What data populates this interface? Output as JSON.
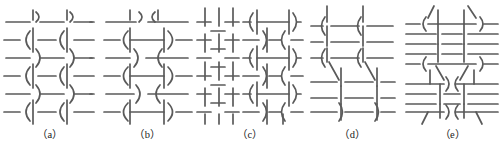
{
  "figure": {
    "type": "textile-weave-structure-diagrams",
    "background_color": "#ffffff",
    "stroke_color": "#5a5a5a",
    "stroke_color_dark": "#4a4a4a",
    "caption_color": "#1a1a1a",
    "panel_count": 5
  },
  "panels": [
    {
      "id": "a",
      "caption": "（a）",
      "label_text": "(a)",
      "description": "Two columns of vertical wavy yarns interlacing with horizontal weft lines; S-curve bends at each crossing",
      "width": 100,
      "height": 128,
      "weave_type": "wavy-warp-double-column",
      "columns": 2,
      "rows": 6
    },
    {
      "id": "b",
      "caption": "（b）",
      "label_text": "(b)",
      "description": "Mirrored curved brackets forming hourglass shapes between two wavy warp columns with long horizontal wefts",
      "width": 95,
      "height": 128,
      "weave_type": "mirrored-hourglass-weave",
      "columns": 2,
      "rows": 6
    },
    {
      "id": "c",
      "caption": "（c）",
      "label_text": "(c)",
      "description": "Plain weave grid on the left half joined to wavy curved-bracket weave on the right half",
      "width": 110,
      "height": 128,
      "weave_type": "plain-weave-plus-wavy",
      "columns": 6,
      "rows": 6
    },
    {
      "id": "d",
      "caption": "（d）",
      "label_text": "(d)",
      "description": "Weave with slanted diagonal warp strands crossing horizontal wefts, two repeat blocks stacked",
      "width": 95,
      "height": 128,
      "weave_type": "diagonal-slanted-warp",
      "columns": 2,
      "rows": 6
    },
    {
      "id": "e",
      "caption": "（e）",
      "label_text": "(e)",
      "description": "Dense stack of closely spaced horizontal wefts with central vertical bundle and flared diagonal ends top and bottom",
      "width": 105,
      "height": 128,
      "weave_type": "dense-weft-central-bundle",
      "columns": 3,
      "rows": 10
    }
  ]
}
